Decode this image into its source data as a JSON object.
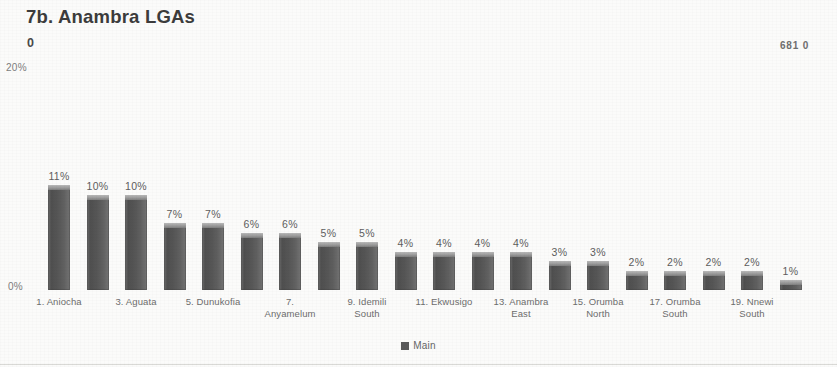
{
  "header": {
    "title": "7b. Anambra LGAs",
    "sub_zero": "0",
    "corner_value": "681 0"
  },
  "legend": {
    "label": "Main",
    "swatch_color": "#5a5a5a"
  },
  "axis": {
    "y_top_label": "20%",
    "y_zero_label": "0%"
  },
  "chart_data": {
    "type": "bar",
    "title": "7b. Anambra LGAs",
    "xlabel": "",
    "ylabel": "",
    "ylim": [
      0,
      20
    ],
    "ytick_labels": [
      "0%",
      "20%"
    ],
    "grid": false,
    "legend_position": "bottom",
    "series": [
      {
        "name": "Main",
        "color": "#5a5a5a",
        "values": [
          11,
          10,
          10,
          7,
          7,
          6,
          6,
          5,
          5,
          4,
          4,
          4,
          4,
          3,
          3,
          2,
          2,
          2,
          2,
          1
        ]
      }
    ],
    "data_labels": [
      "11%",
      "10%",
      "10%",
      "7%",
      "7%",
      "6%",
      "6%",
      "5%",
      "5%",
      "4%",
      "4%",
      "4%",
      "4%",
      "3%",
      "3%",
      "2%",
      "2%",
      "2%",
      "2%",
      "1%"
    ],
    "categories": [
      "1. Aniocha",
      "2",
      "3. Aguata",
      "4",
      "5. Dunukofia",
      "6",
      "7. Anyamelum",
      "8",
      "9. Idemili South",
      "10",
      "11. Ekwusigo",
      "12",
      "13. Anambra East",
      "14",
      "15. Orumba North",
      "16",
      "17. Orumba South",
      "18",
      "19. Nnewi South",
      "20"
    ],
    "visible_tick_labels": [
      {
        "index": 0,
        "line1": "1. Aniocha",
        "line2": ""
      },
      {
        "index": 2,
        "line1": "3. Aguata",
        "line2": ""
      },
      {
        "index": 4,
        "line1": "5. Dunukofia",
        "line2": ""
      },
      {
        "index": 6,
        "line1": "7.",
        "line2": "Anyamelum"
      },
      {
        "index": 8,
        "line1": "9. Idemili",
        "line2": "South"
      },
      {
        "index": 10,
        "line1": "11. Ekwusigo",
        "line2": ""
      },
      {
        "index": 12,
        "line1": "13. Anambra",
        "line2": "East"
      },
      {
        "index": 14,
        "line1": "15. Orumba",
        "line2": "North"
      },
      {
        "index": 16,
        "line1": "17. Orumba",
        "line2": "South"
      },
      {
        "index": 18,
        "line1": "19. Nnewi",
        "line2": "South"
      }
    ]
  }
}
